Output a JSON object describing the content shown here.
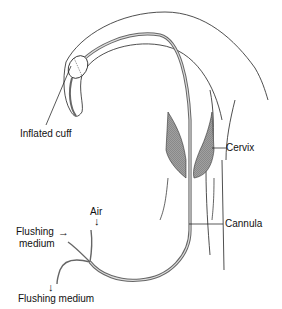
{
  "diagram": {
    "labels": {
      "inflated_cuff": "Inflated cuff",
      "cervix": "Cervix",
      "cannula": "Cannula",
      "air": "Air",
      "flushing_medium_in_line1": "Flushing",
      "flushing_medium_in_line2": "medium",
      "flushing_medium_out": "Flushing medium"
    },
    "arrows": {
      "air": "↓",
      "flushing_in": "→",
      "flushing_out": "↓"
    },
    "colors": {
      "line": "#222222",
      "tube": "#777777",
      "hatch": "#999999"
    }
  }
}
